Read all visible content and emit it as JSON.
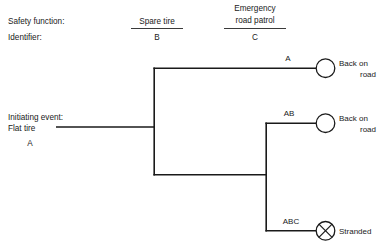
{
  "figure": {
    "kind": "event-tree-diagram",
    "background_color": "#ffffff",
    "line_color": "#1a1a1a"
  },
  "row_labels": {
    "safety_function": "Safety function:",
    "identifier": "Identifier:"
  },
  "columns": [
    {
      "heading_line1": "Spare tire",
      "heading_line2": "",
      "identifier": "B"
    },
    {
      "heading_line1": "Emergency",
      "heading_line2": "road patrol",
      "identifier": "C"
    }
  ],
  "initiating_event": {
    "label_line1": "Initiating event:",
    "label_line2": "Flat tire",
    "identifier": "A"
  },
  "branches": [
    {
      "sequence_id": "A",
      "outcome_line1": "Back on",
      "outcome_line2": "road",
      "node_type": "circle"
    },
    {
      "sequence_id": "AB",
      "outcome_line1": "Back on",
      "outcome_line2": "road",
      "node_type": "circle"
    },
    {
      "sequence_id": "ABC",
      "outcome_line1": "Stranded",
      "outcome_line2": "",
      "node_type": "crossed-circle"
    }
  ]
}
